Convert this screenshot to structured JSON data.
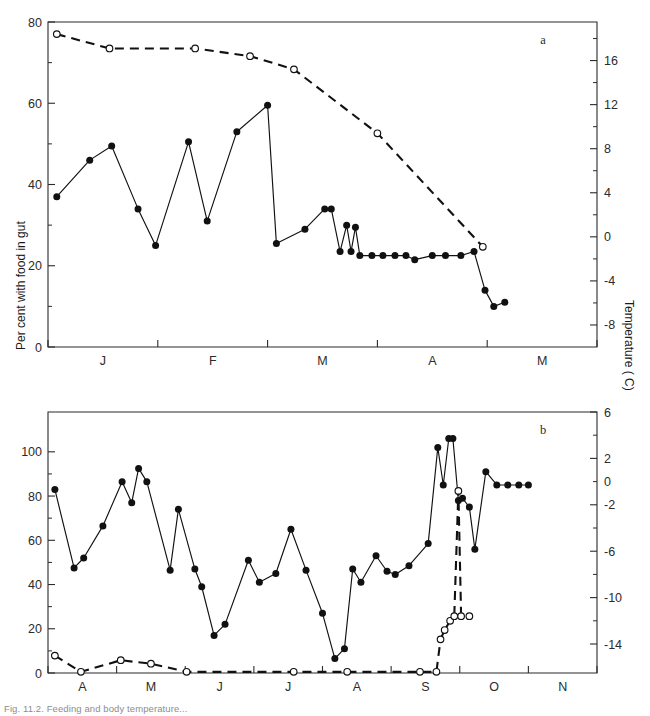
{
  "figure": {
    "panel_a_letter": "a",
    "panel_b_letter": "b",
    "left_axis_title": "Per cent with food in gut",
    "right_axis_title": "Temperature ( C)",
    "caption_fragment": "Fig. 11.2. Feeding and body temperature..."
  },
  "chart_data": [
    {
      "id": "panel-a",
      "type": "line",
      "title": "a",
      "xlabel": "",
      "ylabel": "Per cent with food in gut",
      "y2label": "Temperature ( C)",
      "grid": false,
      "legend_position": "none",
      "xlim": [
        0,
        5
      ],
      "ylim": [
        0,
        80
      ],
      "yticks": [
        0,
        20,
        40,
        60,
        80
      ],
      "y2lim": [
        -10,
        19.5
      ],
      "y2ticks": [
        16,
        12,
        8,
        4,
        0,
        -4,
        -8
      ],
      "y2minorticks": [
        18,
        14,
        10,
        6,
        2,
        -2,
        -6
      ],
      "xtick_positions": [
        0,
        1,
        2,
        3,
        4,
        5
      ],
      "xtick_labels": [
        "J",
        "F",
        "M",
        "A",
        "M"
      ],
      "series": [
        {
          "name": "Per cent with food in gut",
          "marker": "filled-circle",
          "linestyle": "solid",
          "axis": "left",
          "points": [
            [
              0.08,
              37
            ],
            [
              0.38,
              46
            ],
            [
              0.58,
              49.5
            ],
            [
              0.82,
              34
            ],
            [
              0.98,
              25
            ],
            [
              1.28,
              50.5
            ],
            [
              1.45,
              31
            ],
            [
              1.72,
              53
            ],
            [
              2.0,
              59.5
            ],
            [
              2.08,
              25.5
            ],
            [
              2.34,
              29
            ],
            [
              2.52,
              34
            ],
            [
              2.58,
              34
            ],
            [
              2.66,
              23.5
            ],
            [
              2.72,
              30
            ],
            [
              2.76,
              23.5
            ],
            [
              2.8,
              29.5
            ],
            [
              2.84,
              22.5
            ],
            [
              2.95,
              22.5
            ],
            [
              3.05,
              22.5
            ],
            [
              3.16,
              22.5
            ],
            [
              3.26,
              22.5
            ],
            [
              3.34,
              21.5
            ],
            [
              3.5,
              22.5
            ],
            [
              3.62,
              22.5
            ],
            [
              3.76,
              22.5
            ],
            [
              3.88,
              23.5
            ],
            [
              3.98,
              14
            ],
            [
              4.06,
              10
            ],
            [
              4.16,
              11
            ]
          ]
        },
        {
          "name": "Temperature",
          "marker": "open-circle",
          "linestyle": "dashed",
          "axis": "right",
          "points": [
            [
              0.08,
              18.4
            ],
            [
              0.56,
              17.1
            ],
            [
              1.34,
              17.1
            ],
            [
              1.84,
              16.4
            ],
            [
              2.24,
              15.2
            ],
            [
              3.0,
              9.4
            ],
            [
              3.96,
              -0.9
            ]
          ]
        }
      ]
    },
    {
      "id": "panel-b",
      "type": "line",
      "title": "b",
      "xlabel": "",
      "ylabel": "Per cent with food in gut",
      "y2label": "Temperature ( C)",
      "grid": false,
      "legend_position": "none",
      "xlim": [
        0,
        8
      ],
      "ylim": [
        0,
        118
      ],
      "yticks": [
        0,
        20,
        40,
        60,
        80,
        100
      ],
      "y2lim": [
        -16.5,
        6
      ],
      "y2ticks": [
        6,
        2,
        -2,
        -6,
        -10,
        -14
      ],
      "y2labels": [
        "6",
        "2",
        "0",
        "-2",
        "-6",
        "-10",
        "-14"
      ],
      "xtick_positions": [
        0,
        1,
        2,
        3,
        4,
        5,
        6,
        7,
        8
      ],
      "xtick_labels": [
        "A",
        "M",
        "J",
        "J",
        "A",
        "S",
        "O",
        "N"
      ],
      "series": [
        {
          "name": "Per cent with food in gut",
          "marker": "filled-circle",
          "linestyle": "solid",
          "axis": "left",
          "points": [
            [
              0.1,
              83
            ],
            [
              0.38,
              47.5
            ],
            [
              0.52,
              52
            ],
            [
              0.8,
              66.5
            ],
            [
              1.08,
              86.5
            ],
            [
              1.22,
              77
            ],
            [
              1.32,
              92.5
            ],
            [
              1.44,
              86.5
            ],
            [
              1.78,
              46.5
            ],
            [
              1.9,
              74
            ],
            [
              2.14,
              47
            ],
            [
              2.24,
              39
            ],
            [
              2.42,
              17
            ],
            [
              2.58,
              22
            ],
            [
              2.92,
              51
            ],
            [
              3.08,
              41
            ],
            [
              3.32,
              45
            ],
            [
              3.54,
              65
            ],
            [
              3.76,
              46.5
            ],
            [
              4.0,
              27
            ],
            [
              4.18,
              6.5
            ],
            [
              4.32,
              11
            ],
            [
              4.44,
              47
            ],
            [
              4.56,
              41
            ],
            [
              4.78,
              53
            ],
            [
              4.94,
              46
            ],
            [
              5.06,
              44.5
            ],
            [
              5.26,
              48.5
            ],
            [
              5.54,
              58.5
            ],
            [
              5.68,
              102
            ],
            [
              5.76,
              85
            ],
            [
              5.84,
              106
            ],
            [
              5.9,
              106
            ],
            [
              5.98,
              78
            ],
            [
              6.04,
              79
            ],
            [
              6.14,
              75
            ],
            [
              6.22,
              56
            ],
            [
              6.38,
              91
            ],
            [
              6.54,
              85
            ],
            [
              6.7,
              85
            ],
            [
              6.86,
              85
            ],
            [
              7.0,
              85
            ]
          ]
        },
        {
          "name": "Temperature",
          "marker": "open-circle",
          "linestyle": "dashed",
          "axis": "right",
          "points": [
            [
              0.1,
              -15.0
            ],
            [
              0.48,
              -16.4
            ],
            [
              1.06,
              -15.4
            ],
            [
              1.5,
              -15.7
            ],
            [
              2.02,
              -16.4
            ],
            [
              3.58,
              -16.4
            ],
            [
              4.36,
              -16.4
            ],
            [
              5.42,
              -16.4
            ],
            [
              5.66,
              -16.4
            ],
            [
              5.72,
              -13.6
            ],
            [
              5.78,
              -12.8
            ],
            [
              5.86,
              -12.0
            ],
            [
              5.92,
              -11.6
            ],
            [
              5.98,
              -0.8
            ],
            [
              6.02,
              -11.6
            ],
            [
              6.14,
              -11.6
            ]
          ]
        }
      ]
    }
  ]
}
